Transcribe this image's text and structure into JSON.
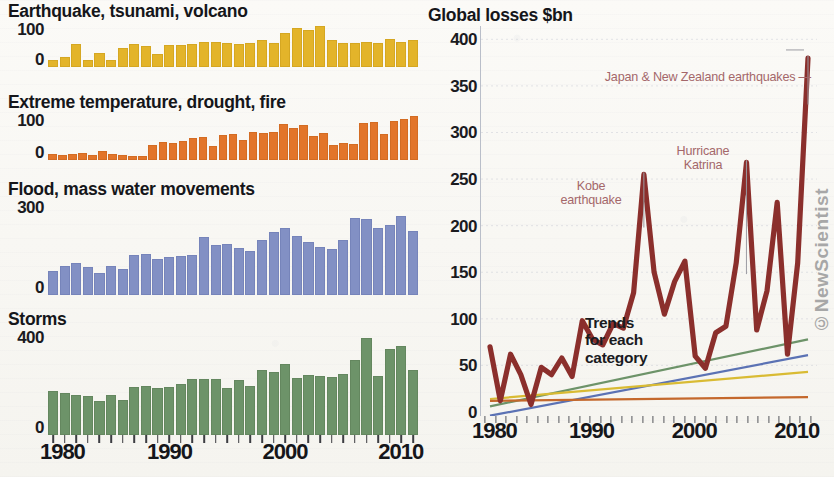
{
  "left_panels": [
    {
      "id": "earthquake",
      "title": "Earthquake, tsunami, volcano",
      "color": "#e3b42a",
      "yticks": [
        "100",
        "0"
      ]
    },
    {
      "id": "extreme-temperature",
      "title": "Extreme temperature, drought, fire",
      "color": "#e2752a",
      "yticks": [
        "100",
        "0"
      ]
    },
    {
      "id": "flood",
      "title": "Flood, mass water movements",
      "color": "#8290c4",
      "yticks": [
        "300",
        "0"
      ]
    },
    {
      "id": "storms",
      "title": "Storms",
      "color": "#6d9369",
      "yticks": [
        "400",
        "0"
      ]
    }
  ],
  "left_xlabels": [
    "1980",
    "1990",
    "2000",
    "2010"
  ],
  "right": {
    "title": "Global losses $bn",
    "yticks": [
      "400",
      "350",
      "300",
      "250",
      "200",
      "150",
      "100",
      "50",
      "0"
    ],
    "xlabels": [
      "1980",
      "1990",
      "2000",
      "2010"
    ],
    "line_color": "#8b2f2c",
    "annotations": [
      {
        "id": "japan-nz",
        "text": "Japan & New Zealand earthquakes"
      },
      {
        "id": "hurricane-katrina",
        "text": "Hurricane\nKatrina"
      },
      {
        "id": "kobe",
        "text": "Kobe\nearthquake"
      }
    ],
    "trend_label": "Trends\nfor each\ncategory",
    "credit": "©NewScientist"
  },
  "chart_data": [
    {
      "type": "bar",
      "id": "earthquake",
      "title": "Earthquake, tsunami, volcano",
      "xlabel": "",
      "ylabel": "",
      "ylim": [
        0,
        130
      ],
      "yticks": [
        0,
        100
      ],
      "color": "#e3b42a",
      "grid": false,
      "x": [
        1980,
        1981,
        1982,
        1983,
        1984,
        1985,
        1986,
        1987,
        1988,
        1989,
        1990,
        1991,
        1992,
        1993,
        1994,
        1995,
        1996,
        1997,
        1998,
        1999,
        2000,
        2001,
        2002,
        2003,
        2004,
        2005,
        2006,
        2007,
        2008,
        2009,
        2010,
        2011
      ],
      "values": [
        22,
        30,
        66,
        22,
        40,
        22,
        55,
        67,
        60,
        38,
        62,
        63,
        67,
        72,
        71,
        70,
        66,
        70,
        78,
        69,
        97,
        112,
        106,
        116,
        78,
        68,
        70,
        72,
        70,
        80,
        72,
        78
      ]
    },
    {
      "type": "bar",
      "id": "extreme-temperature",
      "title": "Extreme temperature, drought, fire",
      "xlabel": "",
      "ylabel": "",
      "ylim": [
        0,
        130
      ],
      "yticks": [
        0,
        100
      ],
      "color": "#e2752a",
      "grid": false,
      "x": [
        1980,
        1981,
        1982,
        1983,
        1984,
        1985,
        1986,
        1987,
        1988,
        1989,
        1990,
        1991,
        1992,
        1993,
        1994,
        1995,
        1996,
        1997,
        1998,
        1999,
        2000,
        2001,
        2002,
        2003,
        2004,
        2005,
        2006,
        2007,
        2008,
        2009,
        2010,
        2011
      ],
      "values": [
        18,
        14,
        16,
        20,
        14,
        26,
        16,
        14,
        12,
        12,
        42,
        50,
        48,
        52,
        60,
        64,
        40,
        70,
        72,
        55,
        76,
        74,
        78,
        98,
        88,
        96,
        66,
        74,
        42,
        48,
        44,
        100,
        104,
        72,
        106,
        112,
        120
      ]
    },
    {
      "type": "bar",
      "id": "flood",
      "title": "Flood, mass water movements",
      "xlabel": "",
      "ylabel": "",
      "ylim": [
        0,
        370
      ],
      "yticks": [
        0,
        300
      ],
      "color": "#8290c4",
      "grid": false,
      "x": [
        1980,
        1981,
        1982,
        1983,
        1984,
        1985,
        1986,
        1987,
        1988,
        1989,
        1990,
        1991,
        1992,
        1993,
        1994,
        1995,
        1996,
        1997,
        1998,
        1999,
        2000,
        2001,
        2002,
        2003,
        2004,
        2005,
        2006,
        2007,
        2008,
        2009,
        2010,
        2011
      ],
      "values": [
        93,
        113,
        125,
        108,
        85,
        112,
        102,
        155,
        158,
        140,
        148,
        152,
        155,
        225,
        195,
        198,
        182,
        172,
        215,
        245,
        258,
        230,
        205,
        185,
        178,
        212,
        300,
        293,
        258,
        272,
        305,
        250
      ]
    },
    {
      "type": "bar",
      "id": "storms",
      "title": "Storms",
      "xlabel": "",
      "ylabel": "",
      "ylim": [
        0,
        470
      ],
      "yticks": [
        0,
        400
      ],
      "color": "#6d9369",
      "grid": false,
      "x": [
        1980,
        1981,
        1982,
        1983,
        1984,
        1985,
        1986,
        1987,
        1988,
        1989,
        1990,
        1991,
        1992,
        1993,
        1994,
        1995,
        1996,
        1997,
        1998,
        1999,
        2000,
        2001,
        2002,
        2003,
        2004,
        2005,
        2006,
        2007,
        2008,
        2009,
        2010,
        2011
      ],
      "values": [
        198,
        188,
        180,
        176,
        152,
        178,
        156,
        215,
        218,
        212,
        213,
        228,
        248,
        252,
        250,
        212,
        245,
        218,
        288,
        280,
        318,
        255,
        268,
        262,
        258,
        272,
        335,
        430,
        262,
        385,
        395,
        290
      ]
    },
    {
      "type": "line",
      "id": "global-losses",
      "title": "Global losses $bn",
      "xlabel": "",
      "ylabel": "Global losses $bn",
      "xlim": [
        1980,
        2011
      ],
      "ylim": [
        0,
        410
      ],
      "yticks": [
        0,
        50,
        100,
        150,
        200,
        250,
        300,
        350,
        400
      ],
      "grid": true,
      "legend": "none",
      "series": [
        {
          "name": "Global losses",
          "color": "#8b2f2c",
          "x": [
            1980,
            1981,
            1982,
            1983,
            1984,
            1985,
            1986,
            1987,
            1988,
            1989,
            1990,
            1991,
            1992,
            1993,
            1994,
            1995,
            1996,
            1997,
            1998,
            1999,
            2000,
            2001,
            2002,
            2003,
            2004,
            2005,
            2006,
            2007,
            2008,
            2009,
            2010,
            2011
          ],
          "values": [
            70,
            12,
            62,
            40,
            8,
            48,
            40,
            58,
            38,
            98,
            78,
            72,
            95,
            90,
            128,
            255,
            150,
            105,
            140,
            162,
            60,
            47,
            85,
            92,
            160,
            268,
            88,
            130,
            225,
            62,
            160,
            380
          ]
        },
        {
          "name": "Storms trend",
          "color": "#6d9369",
          "x": [
            1980,
            2011
          ],
          "values": [
            6,
            78
          ]
        },
        {
          "name": "Flood trend",
          "color": "#5b72b4",
          "x": [
            1980,
            2011
          ],
          "values": [
            -4,
            61
          ]
        },
        {
          "name": "Earthquake trend",
          "color": "#d9bb33",
          "x": [
            1980,
            2011
          ],
          "values": [
            14,
            43
          ]
        },
        {
          "name": "Extreme temperature trend",
          "color": "#c4682c",
          "x": [
            1980,
            2011
          ],
          "values": [
            12,
            16
          ]
        }
      ],
      "annotations": [
        {
          "text": "Kobe earthquake",
          "x": 1995,
          "y": 255
        },
        {
          "text": "Hurricane Katrina",
          "x": 2005,
          "y": 268
        },
        {
          "text": "Japan & New Zealand earthquakes",
          "x": 2011,
          "y": 380
        },
        {
          "text": "Trends for each category",
          "x": 1993,
          "y": 55
        }
      ]
    }
  ]
}
